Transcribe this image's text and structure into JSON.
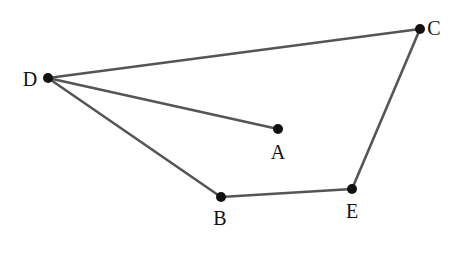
{
  "diagram": {
    "type": "graph",
    "line_color": "#555555",
    "point_color": "#111111",
    "points": [
      {
        "id": "D",
        "label": "D",
        "x": 48,
        "y": 78,
        "label_x": 30,
        "label_y": 79
      },
      {
        "id": "C",
        "label": "C",
        "x": 420,
        "y": 29,
        "label_x": 434,
        "label_y": 28
      },
      {
        "id": "A",
        "label": "A",
        "x": 278,
        "y": 129,
        "label_x": 278,
        "label_y": 152
      },
      {
        "id": "B",
        "label": "B",
        "x": 221,
        "y": 197,
        "label_x": 220,
        "label_y": 218
      },
      {
        "id": "E",
        "label": "E",
        "x": 352,
        "y": 189,
        "label_x": 352,
        "label_y": 211
      }
    ],
    "edges": [
      {
        "from": "D",
        "to": "C"
      },
      {
        "from": "D",
        "to": "A"
      },
      {
        "from": "D",
        "to": "B"
      },
      {
        "from": "B",
        "to": "E"
      },
      {
        "from": "E",
        "to": "C"
      }
    ]
  }
}
